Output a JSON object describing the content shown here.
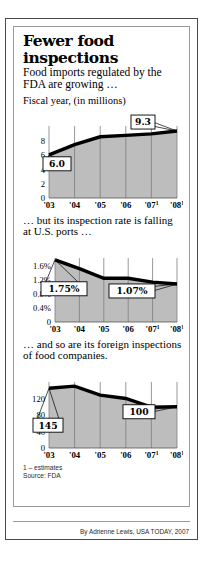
{
  "headline": "Fewer food inspections",
  "deck": "Food imports regulated by the FDA are growing …",
  "bridge_2": "… but its inspection rate is falling at U.S. ports …",
  "bridge_3": "… and so are its foreign inspections of food companies.",
  "footnote_estimates": "1 – estimates",
  "footnote_source": "Source: FDA",
  "credit": "By Adrienne Lewis, USA TODAY, 2007",
  "colors": {
    "line": "#000000",
    "fill": "#bdbdbd",
    "grid": "#7d7d7d",
    "frame_outer": "#4a4a4a",
    "frame_inner": "#9a9a9a",
    "text": "#000000"
  },
  "chart_data": [
    {
      "type": "area",
      "title": "Fiscal year, (in millions)",
      "xlabel": "",
      "ylabel": "",
      "categories": [
        "'03",
        "'04",
        "'05",
        "'06",
        "'07",
        "'08"
      ],
      "tick_superscripts": [
        "",
        "",
        "",
        "",
        "1",
        "1"
      ],
      "values": [
        6.0,
        7.4,
        8.5,
        8.7,
        8.9,
        9.3
      ],
      "ylim": [
        0,
        10
      ],
      "yticks": [
        0,
        2,
        4,
        6,
        8
      ],
      "yticklabels": [
        "0",
        "2",
        "4",
        "6",
        "8"
      ],
      "grid": true,
      "annotations": [
        {
          "label": "6.0",
          "point_index": 0,
          "value": 6.0
        },
        {
          "label": "9.3",
          "point_index": 5,
          "value": 9.3
        }
      ]
    },
    {
      "type": "area",
      "title": "",
      "xlabel": "",
      "ylabel": "",
      "categories": [
        "'03",
        "'04",
        "'05",
        "'06",
        "'07",
        "'08"
      ],
      "tick_superscripts": [
        "",
        "",
        "",
        "",
        "1",
        "1"
      ],
      "values": [
        1.75,
        1.5,
        1.23,
        1.23,
        1.12,
        1.07
      ],
      "ylim": [
        0,
        1.8
      ],
      "yticks": [
        0,
        0.4,
        0.8,
        1.2,
        1.6
      ],
      "yticklabels": [
        "0",
        "0.4%",
        "0.8%",
        "1.2%",
        "1.6%"
      ],
      "grid": true,
      "annotations": [
        {
          "label": "1.75%",
          "point_index": 0,
          "value": 1.75
        },
        {
          "label": "1.07%",
          "point_index": 5,
          "value": 1.07
        }
      ]
    },
    {
      "type": "area",
      "title": "",
      "xlabel": "",
      "ylabel": "",
      "categories": [
        "'03",
        "'04",
        "'05",
        "'06",
        "'07",
        "'08"
      ],
      "tick_superscripts": [
        "",
        "",
        "",
        "",
        "1",
        "1"
      ],
      "values": [
        145,
        150,
        128,
        120,
        99,
        100
      ],
      "ylim": [
        0,
        160
      ],
      "yticks": [
        0,
        40,
        80,
        120
      ],
      "yticklabels": [
        "0",
        "40",
        "80",
        "120"
      ],
      "grid": true,
      "annotations": [
        {
          "label": "145",
          "point_index": 0,
          "value": 145
        },
        {
          "label": "100",
          "point_index": 5,
          "value": 100
        }
      ]
    }
  ]
}
